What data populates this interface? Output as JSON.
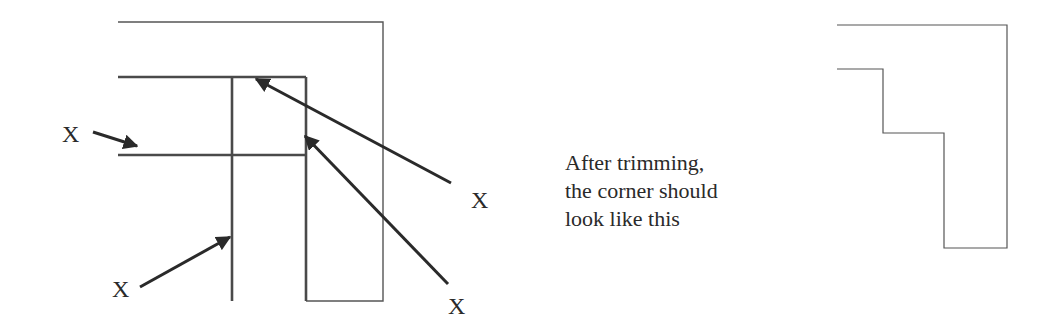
{
  "diagram": {
    "labels": [
      "X",
      "X",
      "X",
      "X"
    ],
    "caption": {
      "lines": [
        "After trimming,",
        "the corner should",
        "look like this"
      ]
    },
    "colors": {
      "thin_line": "#555555",
      "thick_line": "#4a4a4a",
      "arrow": "#2a2a2a",
      "text": "#2a2a2a"
    }
  }
}
